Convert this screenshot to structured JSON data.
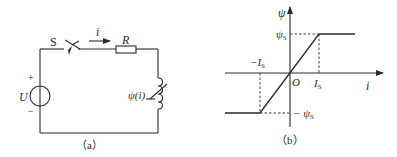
{
  "figure_a": {
    "caption": "（a）",
    "switch_label": "S",
    "current_label": "i",
    "resistor_label": "R",
    "source_label": "U",
    "plus_sign": "+",
    "minus_sign": "−",
    "inductor_label": "ψ(i)"
  },
  "figure_b": {
    "caption": "（b）",
    "y_axis_label": "ψ",
    "x_axis_label": "i",
    "origin_label": "O",
    "psi_s_label": "ψ",
    "psi_s_sub": "S",
    "neg_psi_s_label": "− ψ",
    "neg_psi_s_sub": "S",
    "i_s_label": "I",
    "i_s_sub": "S",
    "neg_i_s_label": "−I",
    "neg_i_s_sub": "S"
  },
  "colors": {
    "stroke": "#2a2a2a",
    "background": "#ffffff"
  }
}
